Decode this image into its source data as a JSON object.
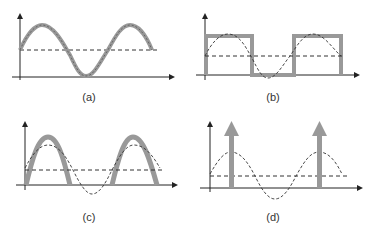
{
  "figure": {
    "panels": [
      {
        "id": "a",
        "label": "(a)",
        "description": "Continuous sinusoidal waveform with DC offset"
      },
      {
        "id": "b",
        "label": "(b)",
        "description": "Square wave following reference sine"
      },
      {
        "id": "c",
        "label": "(c)",
        "description": "Half-wave rectified sine pulses"
      },
      {
        "id": "d",
        "label": "(d)",
        "description": "Impulses at sine peaks"
      }
    ],
    "colors": {
      "thick_signal": "#999999",
      "axis": "#222222",
      "dashed_reference": "#333333",
      "label_text": "#333333"
    }
  }
}
